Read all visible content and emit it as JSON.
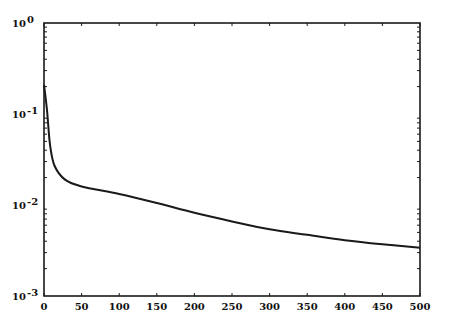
{
  "chart_data": {
    "type": "line",
    "title": "",
    "xlabel": "",
    "ylabel": "",
    "yscale": "log",
    "xlim": [
      0,
      500
    ],
    "ylim": [
      0.001,
      1
    ],
    "grid": false,
    "legend": null,
    "x_ticks": [
      0,
      50,
      100,
      150,
      200,
      250,
      300,
      350,
      400,
      450,
      500
    ],
    "x_tick_labels": [
      "0",
      "50",
      "100",
      "150",
      "200",
      "250",
      "300",
      "350",
      "400",
      "450",
      "500"
    ],
    "y_ticks": [
      1,
      0.1,
      0.01,
      0.001
    ],
    "y_tick_labels": [
      {
        "base": "10",
        "exp": "0"
      },
      {
        "base": "10",
        "exp": "-1"
      },
      {
        "base": "10",
        "exp": "-2"
      },
      {
        "base": "10",
        "exp": "-3"
      }
    ],
    "series": [
      {
        "name": "curve",
        "color": "#1a1a1a",
        "x": [
          0,
          4,
          8,
          14,
          28,
          50,
          100,
          150,
          200,
          250,
          300,
          350,
          400,
          450,
          500
        ],
        "y": [
          0.21,
          0.11,
          0.046,
          0.027,
          0.019,
          0.016,
          0.0132,
          0.0105,
          0.0082,
          0.0066,
          0.0054,
          0.0047,
          0.0041,
          0.0037,
          0.0034
        ]
      }
    ]
  },
  "plot_area": {
    "left": 44,
    "top": 23,
    "right": 420,
    "bottom": 296
  },
  "colors": {
    "axis": "#1a1a1a",
    "line": "#1a1a1a",
    "background": "#ffffff"
  }
}
